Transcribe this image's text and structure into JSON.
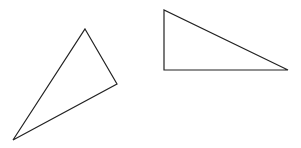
{
  "diagram": {
    "background": "#ffffff",
    "stroke_color": "#222222",
    "shapes": [
      {
        "name": "triangle-obtuse-rotated",
        "type": "triangle",
        "points": [
          [
            85,
            29
          ],
          [
            117,
            84
          ],
          [
            13,
            140
          ]
        ]
      },
      {
        "name": "triangle-right-angled",
        "type": "triangle",
        "points": [
          [
            164,
            10
          ],
          [
            164,
            70
          ],
          [
            288,
            70
          ]
        ]
      }
    ]
  }
}
